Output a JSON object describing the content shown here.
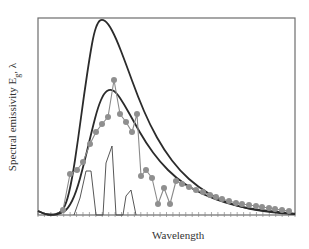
{
  "chart_data": {
    "type": "line",
    "title": "",
    "xlabel": "Wavelength",
    "ylabel": "Spectral emissivity E_g, λ",
    "ylabel_display": "Spectral emissivity E",
    "ylabel_sub": "g",
    "ylabel_suffix": ", λ",
    "grid": false,
    "legend": null,
    "x_ticks_labeled": false,
    "y_ticks_labeled": false,
    "plot_frame": {
      "left": 38,
      "top": 18,
      "right": 295,
      "bottom": 215
    },
    "series": [
      {
        "name": "blackbody (upper)",
        "style": "solid dark line",
        "color": "#2b2b2b",
        "points": [
          [
            38,
            211
          ],
          [
            44,
            214
          ],
          [
            52,
            215
          ],
          [
            60,
            213
          ],
          [
            66,
            205
          ],
          [
            72,
            180
          ],
          [
            78,
            140
          ],
          [
            84,
            95
          ],
          [
            90,
            55
          ],
          [
            94,
            33
          ],
          [
            98,
            22
          ],
          [
            102,
            19
          ],
          [
            108,
            23
          ],
          [
            116,
            38
          ],
          [
            126,
            64
          ],
          [
            138,
            97
          ],
          [
            150,
            125
          ],
          [
            164,
            150
          ],
          [
            180,
            171
          ],
          [
            198,
            187
          ],
          [
            218,
            199
          ],
          [
            240,
            207
          ],
          [
            262,
            211
          ],
          [
            280,
            213
          ],
          [
            295,
            214
          ]
        ]
      },
      {
        "name": "blackbody (lower)",
        "style": "solid dark line",
        "color": "#2b2b2b",
        "points": [
          [
            38,
            211
          ],
          [
            44,
            214
          ],
          [
            52,
            215
          ],
          [
            60,
            214
          ],
          [
            68,
            209
          ],
          [
            76,
            193
          ],
          [
            84,
            164
          ],
          [
            92,
            130
          ],
          [
            98,
            107
          ],
          [
            104,
            93
          ],
          [
            110,
            89
          ],
          [
            116,
            92
          ],
          [
            124,
            104
          ],
          [
            134,
            122
          ],
          [
            146,
            143
          ],
          [
            160,
            162
          ],
          [
            176,
            178
          ],
          [
            194,
            190
          ],
          [
            214,
            199
          ],
          [
            236,
            206
          ],
          [
            258,
            210
          ],
          [
            280,
            212
          ],
          [
            295,
            214
          ]
        ]
      },
      {
        "name": "real surface (dotted markers)",
        "style": "gray line with circle markers",
        "color": "#8a8a8a",
        "points": [
          [
            63,
            210
          ],
          [
            70,
            174
          ],
          [
            77,
            170
          ],
          [
            83,
            162
          ],
          [
            90,
            144
          ],
          [
            96,
            132
          ],
          [
            102,
            124
          ],
          [
            108,
            117
          ],
          [
            114,
            80
          ],
          [
            120,
            114
          ],
          [
            126,
            122
          ],
          [
            132,
            132
          ],
          [
            137,
            114
          ],
          [
            141,
            176
          ],
          [
            146,
            170
          ],
          [
            152,
            178
          ],
          [
            158,
            204
          ],
          [
            164,
            188
          ],
          [
            170,
            204
          ],
          [
            176,
            181
          ],
          [
            182,
            184
          ],
          [
            189,
            187
          ],
          [
            196,
            190
          ],
          [
            203,
            192
          ],
          [
            210,
            195
          ],
          [
            216,
            197
          ],
          [
            222,
            199
          ],
          [
            229,
            201
          ],
          [
            236,
            203
          ],
          [
            242,
            204
          ],
          [
            249,
            205
          ],
          [
            256,
            206
          ],
          [
            262,
            207
          ],
          [
            269,
            208
          ],
          [
            275,
            209
          ],
          [
            282,
            210
          ],
          [
            289,
            211
          ]
        ]
      },
      {
        "name": "band emitter (gas bands)",
        "style": "thin dark line",
        "color": "#444444",
        "points": [
          [
            74,
            215
          ],
          [
            80,
            198
          ],
          [
            86,
            171
          ],
          [
            91,
            171
          ],
          [
            96,
            215
          ],
          [
            103,
            215
          ],
          [
            106,
            163
          ],
          [
            112,
            146
          ],
          [
            116,
            215
          ],
          [
            123,
            215
          ],
          [
            126,
            196
          ],
          [
            131,
            190
          ],
          [
            136,
            215
          ]
        ]
      }
    ],
    "x_minor_tick_count": 40
  }
}
